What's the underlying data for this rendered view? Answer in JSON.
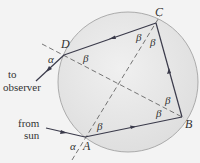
{
  "diagram": {
    "type": "raindrop-rainbow-ray-path",
    "points": {
      "A": {
        "label": "A",
        "x": 85,
        "y": 137
      },
      "B": {
        "label": "B",
        "x": 182,
        "y": 117
      },
      "C": {
        "label": "C",
        "x": 156,
        "y": 23
      },
      "D": {
        "label": "D",
        "x": 64,
        "y": 55
      }
    },
    "angles": {
      "alpha": "α",
      "beta": "β"
    },
    "labels": {
      "from_sun_line1": "from",
      "from_sun_line2": "sun",
      "to_observer_line1": "to",
      "to_observer_line2": "observer"
    },
    "colors": {
      "background": "#f3f3f3",
      "drop_fill": "#e4e4e4",
      "drop_stroke": "#9a9a9a",
      "ray": "#3a3a4a",
      "dashed": "#555555",
      "text": "#333333"
    }
  }
}
